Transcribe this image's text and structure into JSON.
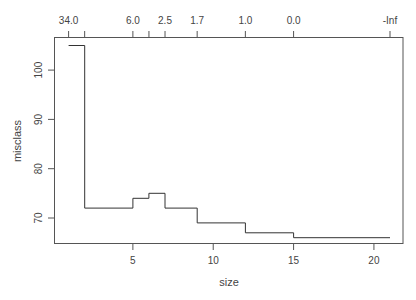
{
  "chart_data": {
    "type": "line",
    "style": "step",
    "title": "",
    "xlabel": "size",
    "ylabel": "misclass",
    "xlim": [
      0.1,
      21.9
    ],
    "ylim": [
      64.8,
      106.6
    ],
    "x_ticks": [
      5,
      10,
      15,
      20
    ],
    "y_ticks": [
      70,
      80,
      90,
      100
    ],
    "top_axis": {
      "positions": [
        1,
        2,
        5,
        6,
        7,
        9,
        12,
        15,
        21
      ],
      "labels": [
        "34.0",
        "",
        "6.0",
        "",
        "2.5",
        "1.7",
        "1.0",
        "0.0",
        "-Inf"
      ]
    },
    "series": [
      {
        "name": "misclass",
        "x": [
          1,
          2,
          5,
          6,
          7,
          9,
          12,
          15,
          21
        ],
        "values": [
          105,
          72,
          74,
          75,
          72,
          69,
          67,
          66,
          66
        ]
      }
    ],
    "grid": false,
    "legend": null
  },
  "labels": {
    "xlabel": "size",
    "ylabel": "misclass",
    "x_ticks": [
      "5",
      "10",
      "15",
      "20"
    ],
    "y_ticks": [
      "70",
      "80",
      "90",
      "100"
    ],
    "top_ticks": [
      "34.0",
      "6.0",
      "2.5",
      "1.7",
      "1.0",
      "0.0",
      "-Inf"
    ]
  }
}
